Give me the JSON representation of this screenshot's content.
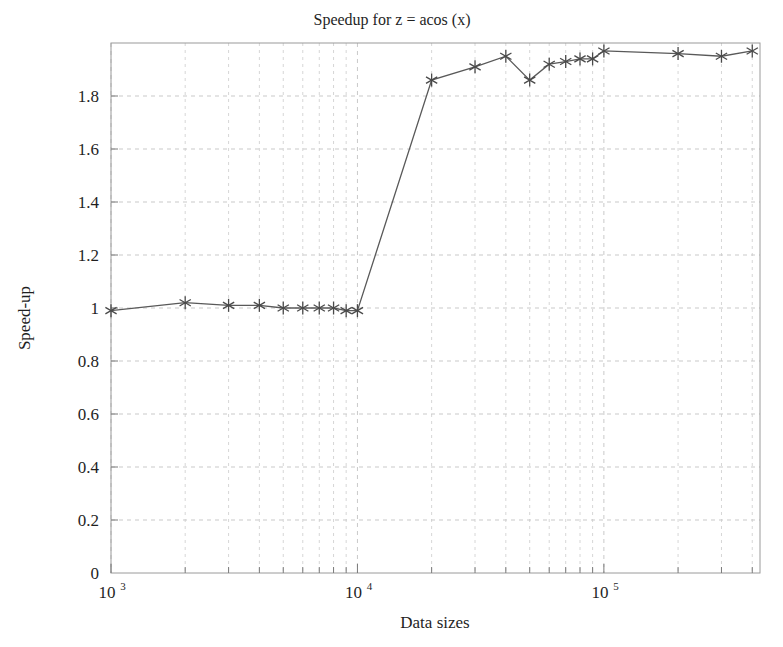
{
  "chart_data": {
    "type": "line",
    "title": "Speedup for z = acos (x)",
    "xlabel": "Data sizes",
    "ylabel": "Speed-up",
    "xscale": "log",
    "xlim": [
      1000,
      430000
    ],
    "ylim": [
      0,
      2
    ],
    "grid": true,
    "legend": null,
    "marker": "asterisk",
    "line_color": "#595959",
    "marker_color": "#4a4a4a",
    "grid_color": "#c9c9c9",
    "frame_color": "#9a9a9a",
    "y_ticks": [
      0,
      0.2,
      0.4,
      0.6,
      0.8,
      1,
      1.2,
      1.4,
      1.6,
      1.8
    ],
    "y_tick_labels": [
      "0",
      "0.2",
      "0.4",
      "0.6",
      "0.8",
      "1",
      "1.2",
      "1.4",
      "1.6",
      "1.8"
    ],
    "x_ticks": [
      1000,
      10000,
      100000
    ],
    "x_tick_labels": [
      "10",
      "10",
      "10"
    ],
    "x_tick_exponents": [
      "3",
      "4",
      "5"
    ],
    "series": [
      {
        "name": "Speed-up",
        "x": [
          1000,
          2000,
          3000,
          4000,
          5000,
          6000,
          7000,
          8000,
          9000,
          10000,
          20000,
          30000,
          40000,
          50000,
          60000,
          70000,
          80000,
          90000,
          100000,
          200000,
          300000,
          400000
        ],
        "y": [
          0.99,
          1.02,
          1.01,
          1.01,
          1.0,
          1.0,
          1.0,
          1.0,
          0.99,
          0.99,
          1.86,
          1.91,
          1.95,
          1.86,
          1.92,
          1.93,
          1.94,
          1.94,
          1.97,
          1.96,
          1.95,
          1.97
        ]
      }
    ]
  }
}
